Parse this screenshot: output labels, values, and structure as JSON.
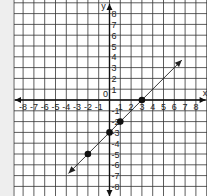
{
  "chart_data": {
    "type": "line",
    "title": "",
    "xlabel": "x",
    "ylabel": "y",
    "origin_label": "0",
    "xlim": [
      -8,
      8
    ],
    "ylim": [
      -8,
      8
    ],
    "grid": true,
    "x_ticks": [
      -8,
      -7,
      -6,
      -5,
      -4,
      -3,
      -2,
      -1,
      1,
      2,
      3,
      4,
      5,
      6,
      7,
      8
    ],
    "y_ticks": [
      8,
      7,
      6,
      5,
      4,
      3,
      2,
      1,
      -1,
      -2,
      -3,
      -4,
      -5,
      -6,
      -7,
      -8
    ],
    "series": [
      {
        "name": "line",
        "equation": "y = x - 3",
        "x": [
          -3.8,
          6.7
        ],
        "y": [
          -6.8,
          3.7
        ],
        "arrows": "both"
      }
    ],
    "points": [
      {
        "x": -2,
        "y": -5
      },
      {
        "x": 0,
        "y": -3
      },
      {
        "x": 1,
        "y": -2
      },
      {
        "x": 3,
        "y": 0
      }
    ],
    "colors": {
      "grid": "#333333",
      "axis": "#111111",
      "line": "#222222",
      "point": "#111111",
      "background": "#ffffff"
    }
  }
}
